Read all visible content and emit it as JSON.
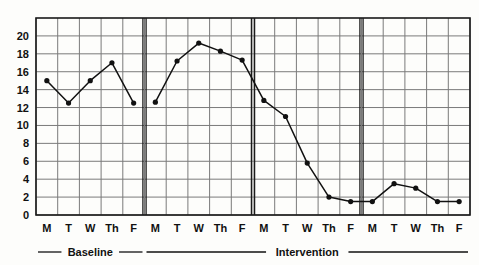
{
  "chart_data": {
    "type": "line",
    "title": "",
    "subtitle": "",
    "xlabel": "",
    "ylabel": "",
    "ylim": [
      0,
      22
    ],
    "yticks": [
      0,
      2,
      4,
      6,
      8,
      10,
      12,
      14,
      16,
      18,
      20
    ],
    "ytick_labels": [
      "0",
      "2",
      "4",
      "6",
      "8",
      "10",
      "12",
      "14",
      "16",
      "18",
      "20"
    ],
    "grid": true,
    "legend": "none",
    "marker": "filled-circle",
    "line_color": "#111111",
    "grid_color": "#7a7a7a",
    "frame_color": "#1a1a1a",
    "x": [
      "M",
      "T",
      "W",
      "Th",
      "F",
      "M",
      "T",
      "W",
      "Th",
      "F",
      "M",
      "T",
      "W",
      "Th",
      "F",
      "M",
      "T",
      "W",
      "Th",
      "F"
    ],
    "xtick_labels": [
      "M",
      "T",
      "W",
      "Th",
      "F",
      "M",
      "T",
      "W",
      "Th",
      "F",
      "M",
      "T",
      "W",
      "Th",
      "F",
      "M",
      "T",
      "W",
      "Th",
      "F"
    ],
    "values": [
      15,
      12.5,
      15,
      17,
      12.5,
      12.6,
      17.2,
      19.2,
      18.3,
      17.3,
      12.8,
      11,
      5.8,
      2,
      1.5,
      1.5,
      3.5,
      3,
      1.5,
      1.5
    ],
    "series": [
      {
        "name": "Behavior count",
        "values": [
          15,
          12.5,
          15,
          17,
          12.5,
          12.6,
          17.2,
          19.2,
          18.3,
          17.3,
          12.8,
          11,
          5.8,
          2,
          1.5,
          1.5,
          3.5,
          3,
          1.5,
          1.5
        ]
      }
    ],
    "phases": [
      {
        "label": "Baseline",
        "start_index": 0,
        "end_index": 4
      },
      {
        "label": "Intervention",
        "start_index": 5,
        "end_index": 19
      }
    ],
    "phase_change_lines": [
      {
        "after_index": 4,
        "style": "double-vertical"
      },
      {
        "after_index": 9,
        "style": "double-vertical"
      },
      {
        "after_index": 14,
        "style": "double-vertical"
      }
    ],
    "annotations": []
  },
  "axis": {
    "y_tick_labels": [
      "20",
      "18",
      "16",
      "14",
      "12",
      "10",
      "8",
      "6",
      "4",
      "2",
      "0"
    ],
    "x_tick_labels": [
      "M",
      "T",
      "W",
      "Th",
      "F",
      "M",
      "T",
      "W",
      "Th",
      "F",
      "M",
      "T",
      "W",
      "Th",
      "F",
      "M",
      "T",
      "W",
      "Th",
      "F"
    ]
  },
  "phase_labels": {
    "baseline": "Baseline",
    "intervention": "Intervention"
  }
}
